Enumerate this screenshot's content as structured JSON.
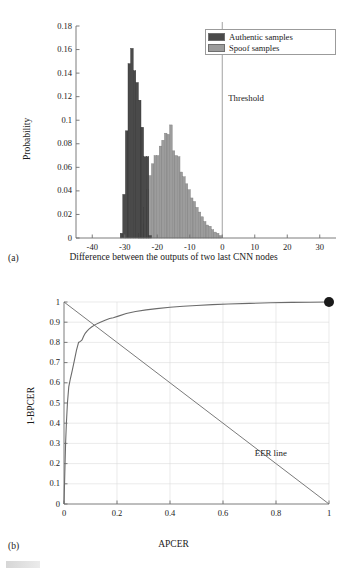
{
  "figure": {
    "panels": [
      {
        "id": "a",
        "label": "(a)",
        "annotation": "Threshold"
      },
      {
        "id": "b",
        "label": "(b)",
        "annotation": "EER line"
      }
    ]
  },
  "chart_data": [
    {
      "type": "bar",
      "subtype": "histogram",
      "panel": "(a)",
      "title": "",
      "xlabel": "Difference between the outputs of two last CNN nodes",
      "ylabel": "Probability",
      "xlim": [
        -45,
        35
      ],
      "ylim": [
        0,
        0.18
      ],
      "xticks": [
        -40,
        -30,
        -20,
        -10,
        0,
        10,
        20,
        30
      ],
      "xtick_labels": [
        "-40",
        "-30",
        "-20",
        "-10",
        "0",
        "10",
        "20",
        "30"
      ],
      "yticks": [
        0,
        0.02,
        0.04,
        0.06,
        0.08,
        0.1,
        0.12,
        0.14,
        0.16,
        0.18
      ],
      "ytick_labels": [
        "0",
        "0.02",
        "0.04",
        "0.06",
        "0.08",
        "0.1",
        "0.12",
        "0.14",
        "0.16",
        "0.18"
      ],
      "grid": false,
      "legend_position": "top-right",
      "annotations": [
        {
          "text": "Threshold",
          "x": 0,
          "note": "vertical line at x = 0"
        }
      ],
      "series": [
        {
          "name": "Authentic samples",
          "color": "#4a4a4a",
          "bin_width": 0.8,
          "x": [
            -31.0,
            -30.2,
            -29.4,
            -28.6,
            -27.8,
            -27.0,
            -26.2,
            -25.4,
            -24.6,
            -23.8,
            -23.0,
            -22.2
          ],
          "values": [
            0.004,
            0.037,
            0.091,
            0.148,
            0.161,
            0.142,
            0.132,
            0.117,
            0.094,
            0.069,
            0.069,
            0.002
          ]
        },
        {
          "name": "Spoof samples",
          "color": "#9c9c9c",
          "bin_width": 0.8,
          "x": [
            -25.4,
            -24.6,
            -23.8,
            -23.0,
            -22.2,
            -21.4,
            -20.6,
            -19.8,
            -19.0,
            -18.2,
            -17.4,
            -16.6,
            -15.8,
            -15.0,
            -14.2,
            -13.4,
            -12.6,
            -11.8,
            -11.0,
            -10.2,
            -9.4,
            -8.6,
            -7.8,
            -7.0,
            -6.2,
            -5.4,
            -4.6,
            -3.8,
            -3.0,
            -2.2,
            -1.4,
            -0.6
          ],
          "values": [
            0.004,
            0.012,
            0.026,
            0.041,
            0.053,
            0.063,
            0.07,
            0.07,
            0.078,
            0.083,
            0.089,
            0.088,
            0.096,
            0.074,
            0.07,
            0.069,
            0.056,
            0.052,
            0.046,
            0.041,
            0.034,
            0.031,
            0.026,
            0.022,
            0.018,
            0.014,
            0.011,
            0.01,
            0.007,
            0.005,
            0.004,
            0.002
          ]
        }
      ]
    },
    {
      "type": "line",
      "subtype": "roc",
      "panel": "(b)",
      "title": "",
      "xlabel": "APCER",
      "ylabel": "1-BPCER",
      "xlim": [
        0,
        1
      ],
      "ylim": [
        0,
        1
      ],
      "xticks": [
        0,
        0.2,
        0.4,
        0.6,
        0.8,
        1
      ],
      "xtick_labels": [
        "0",
        "0.2",
        "0.4",
        "0.6",
        "0.8",
        "1"
      ],
      "yticks": [
        0,
        0.1,
        0.2,
        0.3,
        0.4,
        0.5,
        0.6,
        0.7,
        0.8,
        0.9,
        1
      ],
      "ytick_labels": [
        "0",
        "0.1",
        "0.2",
        "0.3",
        "0.4",
        "0.5",
        "0.6",
        "0.7",
        "0.8",
        "0.9",
        "1"
      ],
      "grid": true,
      "legend_position": "none",
      "annotations": [
        {
          "text": "EER line",
          "x": 0.72,
          "y": 0.25
        }
      ],
      "series": [
        {
          "name": "ROC curve",
          "color": "#6b6b6b",
          "x": [
            0.0,
            0.002,
            0.004,
            0.006,
            0.009,
            0.013,
            0.018,
            0.024,
            0.031,
            0.039,
            0.047,
            0.055,
            0.062,
            0.068,
            0.074,
            0.08,
            0.086,
            0.094,
            0.104,
            0.118,
            0.135,
            0.155,
            0.172,
            0.186,
            0.205,
            0.235,
            0.27,
            0.31,
            0.35,
            0.4,
            0.45,
            0.5,
            0.56,
            0.62,
            0.7,
            0.78,
            0.86,
            0.93,
            1.0
          ],
          "y": [
            0.0,
            0.1,
            0.2,
            0.3,
            0.4,
            0.5,
            0.58,
            0.62,
            0.66,
            0.71,
            0.76,
            0.8,
            0.805,
            0.812,
            0.83,
            0.845,
            0.855,
            0.866,
            0.876,
            0.888,
            0.898,
            0.91,
            0.918,
            0.922,
            0.93,
            0.943,
            0.953,
            0.961,
            0.967,
            0.974,
            0.979,
            0.983,
            0.987,
            0.99,
            0.993,
            0.996,
            0.998,
            0.999,
            1.0
          ]
        },
        {
          "name": "EER line",
          "color": "#6b6b6b",
          "x": [
            0,
            1
          ],
          "y": [
            1,
            0
          ]
        }
      ],
      "markers": [
        {
          "name": "end-point",
          "x": 1,
          "y": 1,
          "color": "#1a1a1a",
          "radius": 5
        }
      ]
    }
  ]
}
